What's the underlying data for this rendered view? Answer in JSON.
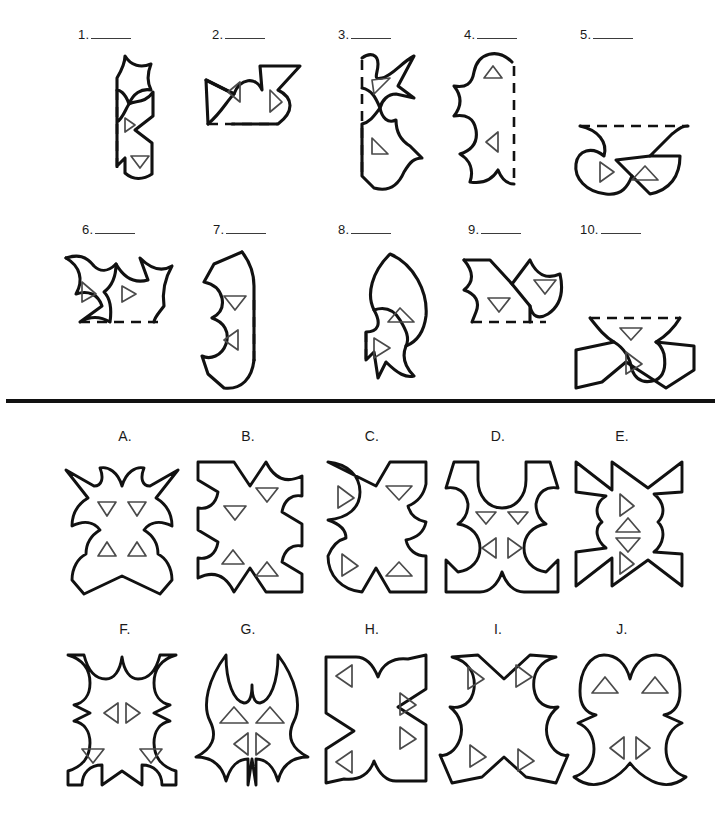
{
  "page": {
    "type": "paper-folding-punch-puzzle-worksheet",
    "background_color": "#ffffff",
    "ink_color": "#111111",
    "hole_color": "#4a4a4a",
    "divider": {
      "present": true,
      "y": 400,
      "thickness": 4
    }
  },
  "questions": {
    "blank_mark": "____",
    "items": [
      {
        "number": "1.",
        "answer_value": "",
        "fold_line": "vertical-left",
        "holes": [
          "right-triangle",
          "down-triangle"
        ]
      },
      {
        "number": "2.",
        "answer_value": "",
        "fold_line": "horizontal-bottom",
        "holes": [
          "left-triangle",
          "right-triangle"
        ]
      },
      {
        "number": "3.",
        "answer_value": "",
        "fold_line": "vertical-left",
        "holes": [
          "right-triangle",
          "right-triangle"
        ]
      },
      {
        "number": "4.",
        "answer_value": "",
        "fold_line": "vertical-right",
        "holes": [
          "up-triangle",
          "left-triangle"
        ]
      },
      {
        "number": "5.",
        "answer_value": "",
        "fold_line": "horizontal-top",
        "holes": [
          "right-triangle",
          "up-triangle"
        ]
      },
      {
        "number": "6.",
        "answer_value": "",
        "fold_line": "horizontal-bottom",
        "holes": [
          "right-triangle",
          "right-triangle"
        ]
      },
      {
        "number": "7.",
        "answer_value": "",
        "fold_line": "vertical-right",
        "holes": [
          "down-triangle",
          "left-triangle"
        ]
      },
      {
        "number": "8.",
        "answer_value": "",
        "fold_line": "vertical-left",
        "holes": [
          "up-triangle",
          "right-triangle"
        ]
      },
      {
        "number": "9.",
        "answer_value": "",
        "fold_line": "horizontal-bottom",
        "holes": [
          "down-triangle",
          "down-triangle"
        ]
      },
      {
        "number": "10.",
        "answer_value": "",
        "fold_line": "horizontal-top",
        "holes": [
          "down-triangle",
          "right-triangle"
        ]
      }
    ]
  },
  "answers": {
    "items": [
      {
        "letter": "A.",
        "symmetry": "vertical-mirror",
        "holes": [
          "down-triangle",
          "down-triangle",
          "up-triangle",
          "up-triangle"
        ]
      },
      {
        "letter": "B.",
        "symmetry": "point",
        "holes": [
          "down-triangle",
          "down-triangle",
          "up-triangle",
          "up-triangle"
        ]
      },
      {
        "letter": "C.",
        "symmetry": "point",
        "holes": [
          "right-triangle",
          "down-triangle",
          "right-triangle",
          "up-triangle"
        ]
      },
      {
        "letter": "D.",
        "symmetry": "vertical-mirror",
        "holes": [
          "down-triangle",
          "down-triangle",
          "left-triangle",
          "right-triangle"
        ]
      },
      {
        "letter": "E.",
        "symmetry": "point",
        "holes": [
          "right-triangle",
          "up-triangle",
          "down-triangle",
          "right-triangle"
        ]
      },
      {
        "letter": "F.",
        "symmetry": "vertical-mirror",
        "holes": [
          "left-triangle",
          "right-triangle",
          "down-triangle",
          "down-triangle"
        ]
      },
      {
        "letter": "G.",
        "symmetry": "vertical-mirror",
        "holes": [
          "up-triangle",
          "up-triangle",
          "left-triangle",
          "right-triangle"
        ]
      },
      {
        "letter": "H.",
        "symmetry": "point",
        "holes": [
          "left-triangle",
          "right-triangle",
          "right-triangle",
          "left-triangle"
        ]
      },
      {
        "letter": "I.",
        "symmetry": "point",
        "holes": [
          "right-triangle",
          "right-triangle",
          "right-triangle",
          "right-triangle"
        ]
      },
      {
        "letter": "J.",
        "symmetry": "vertical-mirror",
        "holes": [
          "up-triangle",
          "up-triangle",
          "left-triangle",
          "right-triangle"
        ]
      }
    ]
  }
}
